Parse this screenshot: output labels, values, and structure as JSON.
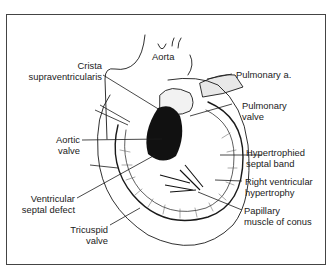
{
  "diagram": {
    "labels": {
      "aorta": "Aorta",
      "crista_1": "Crista",
      "crista_2": "supraventricularis",
      "pulmonary_artery": "Pulmonary a.",
      "pulmonary_valve_1": "Pulmonary",
      "pulmonary_valve_2": "valve",
      "aortic_valve_1": "Aortic",
      "aortic_valve_2": "valve",
      "septal_band_1": "Hypertrophied",
      "septal_band_2": "septal band",
      "rvh_1": "Right ventricular",
      "rvh_2": "hypertrophy",
      "vsd_1": "Ventricular",
      "vsd_2": "septal defect",
      "papillary_1": "Papillary",
      "papillary_2": "muscle of conus",
      "tricuspid_1": "Tricuspid",
      "tricuspid_2": "valve"
    },
    "colors": {
      "line": "#1a1a1a",
      "frame": "#444444",
      "background": "#ffffff"
    }
  }
}
